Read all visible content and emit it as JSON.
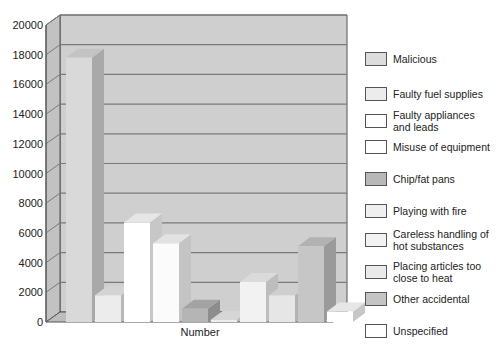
{
  "chart_data": {
    "type": "bar",
    "title": "",
    "xlabel": "Number",
    "ylabel": "",
    "ylim": [
      0,
      20000
    ],
    "yticks": [
      0,
      2000,
      4000,
      6000,
      8000,
      10000,
      12000,
      14000,
      16000,
      18000,
      20000
    ],
    "grid": true,
    "legend_position": "right",
    "categories": [
      "Number"
    ],
    "series": [
      {
        "name": "Malicious",
        "values": [
          17800
        ],
        "color": "#d9d9d9"
      },
      {
        "name": "Faulty fuel supplies",
        "values": [
          1800
        ],
        "color": "#ececec"
      },
      {
        "name": "Faulty appliances and leads",
        "values": [
          6700
        ],
        "color": "#ffffff"
      },
      {
        "name": "Misuse of equipment",
        "values": [
          5300
        ],
        "color": "#fbfbfb"
      },
      {
        "name": "Chip/fat pans",
        "values": [
          900
        ],
        "color": "#b5b5b5"
      },
      {
        "name": "Playing with fire",
        "values": [
          150
        ],
        "color": "#eeeeee"
      },
      {
        "name": "Careless handling of hot substances",
        "values": [
          2700
        ],
        "color": "#f2f2f2"
      },
      {
        "name": "Placing articles too close to heat",
        "values": [
          1800
        ],
        "color": "#e6e6e6"
      },
      {
        "name": "Other accidental",
        "values": [
          5100
        ],
        "color": "#c6c6c6"
      },
      {
        "name": "Unspecified",
        "values": [
          700
        ],
        "color": "#ffffff"
      }
    ]
  },
  "legend": {
    "items": [
      {
        "label": "Malicious",
        "color": "#dcdcdc"
      },
      {
        "label": "Faulty fuel supplies",
        "color": "#ececec"
      },
      {
        "label": "Faulty appliances\nand leads",
        "color": "#ffffff"
      },
      {
        "label": "Misuse of equipment",
        "color": "#ffffff"
      },
      {
        "label": "Chip/fat pans",
        "color": "#b8b8b8"
      },
      {
        "label": "Playing with fire",
        "color": "#efefef"
      },
      {
        "label": "Careless handling of\nhot substances",
        "color": "#f2f2f2"
      },
      {
        "label": "Placing articles too\nclose to heat",
        "color": "#eaeaea"
      },
      {
        "label": "Other accidental",
        "color": "#c4c4c4"
      },
      {
        "label": "Unspecified",
        "color": "#ffffff"
      }
    ]
  },
  "colors": {
    "wall": "#cfcfcf",
    "side_wall": "#c2c2c2",
    "floor": "#bdbdbd",
    "gridline": "#7a7a7a",
    "axis": "#555555"
  }
}
